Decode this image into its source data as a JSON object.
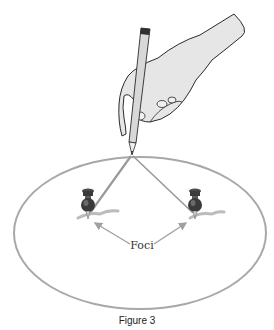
{
  "figure": {
    "foci_label": "Foci",
    "caption": "Figure 3"
  },
  "colors": {
    "ellipse": "#a8a8a8",
    "string": "#9a9a9a",
    "arrow": "#a0a0a0",
    "pin_dark": "#3a3a3a",
    "pin_mid": "#6a6a6a",
    "hand_fill": "#e6e6e6",
    "hand_stroke": "#2a2a2a",
    "pencil_fill": "#d8d8d8"
  }
}
